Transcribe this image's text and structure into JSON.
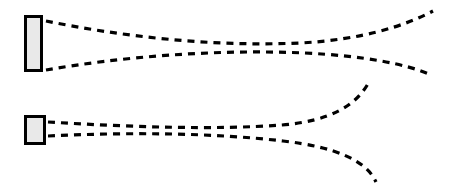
{
  "canvas": {
    "width": 451,
    "height": 192,
    "background_color": "#ffffff",
    "title": "Dashed ray trajectory diagram"
  },
  "style": {
    "stroke_color": "#000000",
    "rect_fill_color": "#e9e9e9",
    "rect_border_color": "#000000",
    "rect_border_width": 3,
    "ray_stroke_width": 3.2,
    "dash_pattern": "7 6"
  },
  "shapes": [
    {
      "name": "tall-rectangle",
      "role": "upper-source-block",
      "x": 24,
      "y": 15,
      "width": 19,
      "height": 57,
      "fill": "#e9e9e9",
      "stroke": "#000000"
    },
    {
      "name": "small-square",
      "role": "lower-source-block",
      "x": 24,
      "y": 115,
      "width": 22,
      "height": 30,
      "fill": "#e9e9e9",
      "stroke": "#000000"
    }
  ],
  "rays": [
    {
      "name": "ray-upper-outer",
      "label": "Ray 1",
      "start": [
        46,
        21
      ],
      "end": [
        433,
        11
      ],
      "path": "M 46 21 C 120 36, 210 47, 300 43 C 360 40, 405 26, 433 11"
    },
    {
      "name": "ray-upper-inner",
      "label": "Ray 2",
      "start": [
        46,
        70
      ],
      "end": [
        429,
        74
      ],
      "path": "M 46 70 C 120 57, 215 49, 305 53 C 365 56, 405 64, 429 74"
    },
    {
      "name": "ray-lower-upper",
      "label": "Ray 3",
      "start": [
        48,
        122
      ],
      "end": [
        369,
        82
      ],
      "path": "M 48 122 C 130 127, 215 130, 282 125 C 330 121, 356 106, 369 82"
    },
    {
      "name": "ray-lower-outer",
      "label": "Ray 4",
      "start": [
        48,
        136
      ],
      "end": [
        376,
        182
      ],
      "path": "M 48 136 C 130 132, 215 133, 283 141 C 335 147, 366 160, 376 182"
    }
  ]
}
